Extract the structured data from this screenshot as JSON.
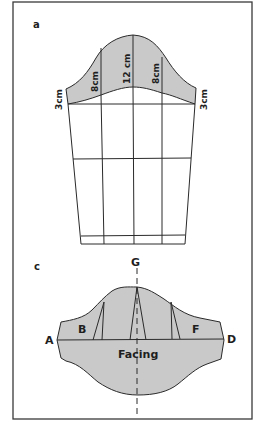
{
  "figure": {
    "background": "#ffffff",
    "fill_color": "#c9c9c9",
    "line_color": "#2a2a2a"
  },
  "section_a": {
    "label": "a",
    "measurements": {
      "left_edge": "3cm",
      "left_inner": "8cm",
      "center": "12 cm",
      "right_inner": "8cm",
      "right_edge": "3cm"
    }
  },
  "section_c": {
    "label": "c",
    "points": {
      "top": "G",
      "left": "A",
      "right": "D"
    },
    "regions": {
      "back": "B",
      "front": "F",
      "facing": "Facing"
    }
  }
}
